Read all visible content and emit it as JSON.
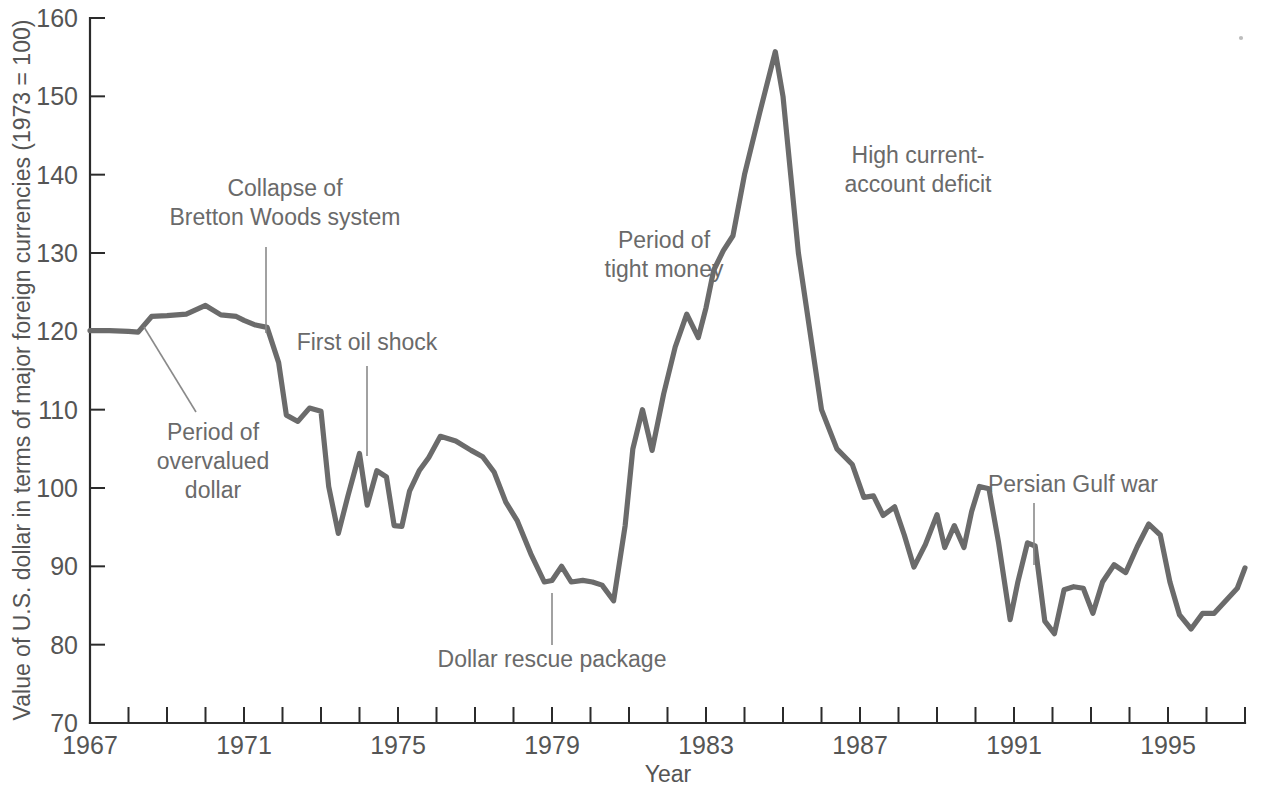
{
  "figure": {
    "background_color": "#ffffff",
    "line_color": "#6b6b6b",
    "axis_color": "#2b2b2b",
    "text_color": "#555555",
    "annotation_color": "#6a6a6a"
  },
  "axes": {
    "x_title": "Year",
    "y_title": "Value of U.S. dollar in terms of major foreign currencies (1973 = 100)",
    "x_tick_labels": [
      "1967",
      "1971",
      "1975",
      "1979",
      "1983",
      "1987",
      "1991",
      "1995"
    ],
    "x_tick_values": [
      1967,
      1971,
      1975,
      1979,
      1983,
      1987,
      1991,
      1995
    ],
    "y_tick_labels": [
      "70",
      "80",
      "90",
      "100",
      "110",
      "120",
      "130",
      "140",
      "150",
      "160"
    ],
    "y_tick_values": [
      70,
      80,
      90,
      100,
      110,
      120,
      130,
      140,
      150,
      160
    ]
  },
  "annotations": [
    {
      "id": "collapse-bretton-woods",
      "lines": [
        "Collapse of",
        "Bretton Woods system"
      ],
      "text_x": 285,
      "text_y": 196,
      "anchor": "middle",
      "leader": {
        "x1": 266,
        "y1": 247,
        "x2": 266,
        "y2": 333
      }
    },
    {
      "id": "period-overvalued-dollar",
      "lines": [
        "Period of",
        "overvalued",
        "dollar"
      ],
      "text_x": 213,
      "text_y": 440,
      "anchor": "middle",
      "leader": {
        "x1": 144,
        "y1": 327,
        "x2": 196,
        "y2": 412
      }
    },
    {
      "id": "first-oil-shock",
      "lines": [
        "First oil shock"
      ],
      "text_x": 367,
      "text_y": 350,
      "anchor": "middle",
      "leader": {
        "x1": 367,
        "y1": 366,
        "x2": 367,
        "y2": 456
      }
    },
    {
      "id": "dollar-rescue-package",
      "lines": [
        "Dollar rescue package"
      ],
      "text_x": 552,
      "text_y": 667,
      "anchor": "middle",
      "leader": {
        "x1": 552,
        "y1": 593,
        "x2": 552,
        "y2": 645
      }
    },
    {
      "id": "period-tight-money",
      "lines": [
        "Period of",
        "tight money"
      ],
      "text_x": 664,
      "text_y": 248,
      "anchor": "middle",
      "leader": null
    },
    {
      "id": "high-current-account-deficit",
      "lines": [
        "High current-",
        "account deficit"
      ],
      "text_x": 918,
      "text_y": 163,
      "anchor": "middle",
      "leader": null
    },
    {
      "id": "persian-gulf-war",
      "lines": [
        "Persian Gulf war"
      ],
      "text_x": 1073,
      "text_y": 492,
      "anchor": "middle",
      "leader": {
        "x1": 1034,
        "y1": 503,
        "x2": 1034,
        "y2": 565
      }
    }
  ],
  "chart_data": {
    "type": "line",
    "title": "",
    "subtitle": "",
    "xlabel": "Year",
    "ylabel": "Value of U.S. dollar in terms of major foreign currencies (1973 = 100)",
    "xlim": [
      1967,
      1997
    ],
    "ylim": [
      70,
      160
    ],
    "grid": false,
    "legend": null,
    "series": [
      {
        "name": "U.S. dollar index (1973 = 100)",
        "color": "#6b6b6b",
        "x": [
          1967.0,
          1967.5,
          1968.0,
          1968.25,
          1968.6,
          1969.0,
          1969.5,
          1970.0,
          1970.4,
          1970.8,
          1971.0,
          1971.3,
          1971.6,
          1971.9,
          1972.1,
          1972.4,
          1972.7,
          1973.0,
          1973.2,
          1973.45,
          1973.7,
          1974.0,
          1974.2,
          1974.45,
          1974.7,
          1974.9,
          1975.1,
          1975.3,
          1975.55,
          1975.8,
          1976.1,
          1976.5,
          1976.9,
          1977.2,
          1977.5,
          1977.8,
          1978.1,
          1978.45,
          1978.8,
          1979.0,
          1979.25,
          1979.5,
          1979.8,
          1980.05,
          1980.3,
          1980.6,
          1980.9,
          1981.1,
          1981.35,
          1981.6,
          1981.9,
          1982.2,
          1982.5,
          1982.8,
          1983.0,
          1983.2,
          1983.45,
          1983.7,
          1984.0,
          1984.4,
          1984.8,
          1985.0,
          1985.2,
          1985.4,
          1985.7,
          1986.0,
          1986.4,
          1986.8,
          1987.1,
          1987.35,
          1987.6,
          1987.9,
          1988.15,
          1988.4,
          1988.7,
          1989.0,
          1989.2,
          1989.45,
          1989.7,
          1989.9,
          1990.1,
          1990.35,
          1990.6,
          1990.9,
          1991.1,
          1991.35,
          1991.55,
          1991.8,
          1992.05,
          1992.3,
          1992.55,
          1992.8,
          1993.05,
          1993.3,
          1993.6,
          1993.9,
          1994.2,
          1994.5,
          1994.8,
          1995.05,
          1995.3,
          1995.6,
          1995.9,
          1996.2,
          1996.5,
          1996.8,
          1997.0
        ],
        "y": [
          120.1,
          120.1,
          120.0,
          119.9,
          121.9,
          122.0,
          122.2,
          123.3,
          122.1,
          121.9,
          121.4,
          120.8,
          120.5,
          116.0,
          109.3,
          108.5,
          110.2,
          109.8,
          100.2,
          94.2,
          99.0,
          104.4,
          97.8,
          102.2,
          101.4,
          95.2,
          95.1,
          99.6,
          102.2,
          103.9,
          106.6,
          106.0,
          104.8,
          104.0,
          102.0,
          98.2,
          95.8,
          91.6,
          88.0,
          88.2,
          90.0,
          88.0,
          88.2,
          88.0,
          87.6,
          85.6,
          95.2,
          105.0,
          110.0,
          104.8,
          112.0,
          118.0,
          122.2,
          119.2,
          123.0,
          127.8,
          130.3,
          132.2,
          140.0,
          148.0,
          155.7,
          150.0,
          140.0,
          130.0,
          120.0,
          110.0,
          105.0,
          103.0,
          98.8,
          99.0,
          96.5,
          97.6,
          94.0,
          89.9,
          92.8,
          96.6,
          92.4,
          95.2,
          92.4,
          97.0,
          100.2,
          99.9,
          93.0,
          83.2,
          88.0,
          93.0,
          92.6,
          83.0,
          81.4,
          87.0,
          87.4,
          87.2,
          84.0,
          88.0,
          90.2,
          89.2,
          92.5,
          95.4,
          94.0,
          88.0,
          83.8,
          82.0,
          84.0,
          84.0,
          85.6,
          87.2,
          89.8
        ]
      }
    ]
  }
}
